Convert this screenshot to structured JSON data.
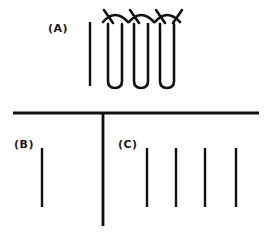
{
  "figure": {
    "background_color": "#ffffff",
    "stroke_color": "#111111",
    "width": 272,
    "height": 236
  },
  "labels": {
    "a": "(A)",
    "b": "(B)",
    "c": "(C)"
  },
  "sections": {
    "a": {
      "label": "(A)",
      "label_x": 48,
      "label_y": 32,
      "description": "coil winding with three hairpin loops and crossing arcs beside a single vertical conductor",
      "loop_count": 3,
      "strand_count": 6,
      "reference_line": {
        "x": 90,
        "y1": 22,
        "y2": 86,
        "stroke_width": 2.4
      },
      "coil": {
        "stroke_width": 2.6,
        "top_y": 22,
        "bottom_y": 88,
        "arc_apex_y": 10,
        "leg_gap": 14,
        "pair_pitch": 26,
        "first_leg_x": 108,
        "bottom_radius": 7
      }
    },
    "b": {
      "label": "(B)",
      "label_x": 14,
      "label_y": 148,
      "description": "single vertical conductor",
      "line_count": 1,
      "lines": [
        {
          "x": 42,
          "y1": 148,
          "y2": 207,
          "stroke_width": 2.4
        }
      ]
    },
    "c": {
      "label": "(C)",
      "label_x": 118,
      "label_y": 148,
      "description": "four parallel vertical conductors",
      "line_count": 4,
      "lines": [
        {
          "x": 147,
          "y1": 148,
          "y2": 207,
          "stroke_width": 2.4
        },
        {
          "x": 176,
          "y1": 148,
          "y2": 207,
          "stroke_width": 2.4
        },
        {
          "x": 205,
          "y1": 148,
          "y2": 207,
          "stroke_width": 2.4
        },
        {
          "x": 236,
          "y1": 148,
          "y2": 207,
          "stroke_width": 2.4
        }
      ]
    }
  },
  "divider": {
    "description": "horizontal rule with vertical T stem separating section A from sections B and C",
    "horizontal": {
      "x1": 13,
      "x2": 259,
      "y": 113,
      "stroke_width": 2.8
    },
    "stem": {
      "x": 103,
      "y1": 113,
      "y2": 226,
      "stroke_width": 2.8
    }
  }
}
